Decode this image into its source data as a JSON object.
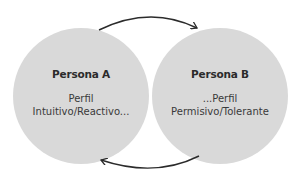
{
  "diagram": {
    "nodes": [
      {
        "id": "A",
        "title": "Persona A",
        "line1": "Perfil",
        "line2": "Intuitivo/Reactivo..."
      },
      {
        "id": "B",
        "title": "Persona B",
        "line1": "...Perfil",
        "line2": "Permisivo/Tolerante"
      }
    ],
    "edges": [
      {
        "from": "A",
        "to": "B",
        "position": "top"
      },
      {
        "from": "B",
        "to": "A",
        "position": "bottom"
      }
    ],
    "colors": {
      "circle_fill": "#d9d9d9",
      "arrow": "#2b2b2b",
      "text": "#2b2b2b"
    }
  }
}
